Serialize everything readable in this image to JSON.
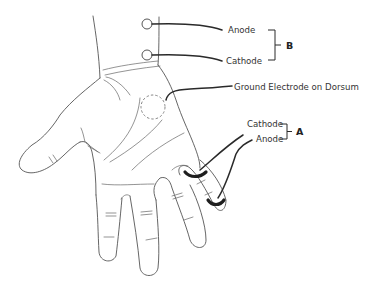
{
  "figure": {
    "type": "anatomical illustration",
    "colors": {
      "outline": "#555555",
      "lead_wire": "#2a2a2a",
      "ring_electrode": "#1e1e1e",
      "background": "#ffffff"
    }
  },
  "labels": {
    "b_anode": "Anode",
    "b_cathode": "Cathode",
    "ground": "Ground Electrode on Dorsum",
    "a_cathode": "Cathode",
    "a_anode": "Anode"
  },
  "groups": {
    "a": "A",
    "b": "B"
  }
}
